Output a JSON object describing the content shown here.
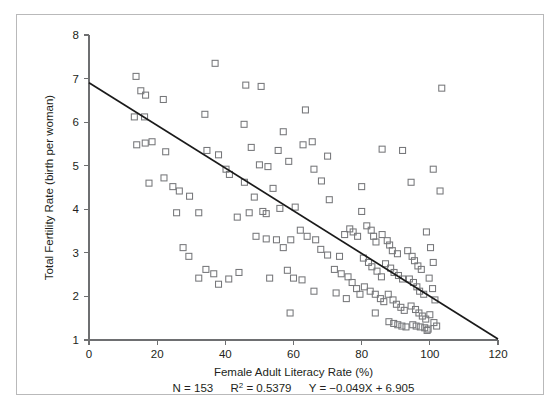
{
  "figure": {
    "background_color": "#ffffff",
    "border_color": "#b9b9ba",
    "marker_color": "#76777a",
    "line_color": "#1a1a1a",
    "axis_color": "#6e6f71"
  },
  "chart_data": {
    "type": "scatter",
    "title": "",
    "xlabel": "Female Adult Literacy Rate (%)",
    "ylabel": "Total Fertility Rate (birth per woman)",
    "xlim": [
      0,
      120
    ],
    "ylim": [
      1,
      8
    ],
    "xticks": [
      0,
      20,
      40,
      60,
      80,
      100,
      120
    ],
    "yticks": [
      1,
      2,
      3,
      4,
      5,
      6,
      7,
      8
    ],
    "xtick_labels": [
      "0",
      "20",
      "40",
      "60",
      "80",
      "100",
      "120"
    ],
    "ytick_labels": [
      "1",
      "2",
      "3",
      "4",
      "5",
      "6",
      "7",
      "8"
    ],
    "grid": false,
    "legend": null,
    "marker_style": "open-square",
    "annotations": {
      "n_label": "N = 153",
      "r2_label_prefix": "R",
      "r2_label_sup": "2",
      "r2_label_value": " = 0.5379",
      "equation": "Y = −0.049X + 6.905",
      "stats_text": "N = 153    R2 = 0.5379    Y = −0.049X + 6.905"
    },
    "fit": {
      "type": "linear",
      "slope": -0.049,
      "intercept": 6.905,
      "r_squared": 0.5379,
      "n": 153,
      "x_start": 0,
      "y_start": 6.905,
      "x_end": 120,
      "y_end": 1.025
    },
    "points": [
      [
        13.8,
        7.05
      ],
      [
        15.2,
        6.72
      ],
      [
        16.6,
        6.62
      ],
      [
        13.3,
        6.12
      ],
      [
        16.3,
        6.12
      ],
      [
        21.8,
        6.52
      ],
      [
        14.0,
        5.48
      ],
      [
        16.5,
        5.52
      ],
      [
        18.5,
        5.55
      ],
      [
        22.5,
        5.32
      ],
      [
        17.6,
        4.6
      ],
      [
        22.0,
        4.72
      ],
      [
        24.6,
        4.52
      ],
      [
        26.5,
        4.42
      ],
      [
        29.5,
        4.3
      ],
      [
        25.7,
        3.92
      ],
      [
        32.2,
        3.92
      ],
      [
        27.6,
        3.12
      ],
      [
        29.3,
        2.92
      ],
      [
        32.2,
        2.42
      ],
      [
        37.0,
        7.35
      ],
      [
        34.0,
        6.18
      ],
      [
        34.6,
        5.35
      ],
      [
        38.0,
        5.25
      ],
      [
        40.2,
        4.92
      ],
      [
        41.2,
        4.8
      ],
      [
        41.0,
        2.4
      ],
      [
        34.3,
        2.62
      ],
      [
        36.6,
        2.52
      ],
      [
        38.0,
        2.28
      ],
      [
        46.0,
        6.85
      ],
      [
        50.5,
        6.82
      ],
      [
        45.5,
        5.95
      ],
      [
        47.6,
        5.42
      ],
      [
        50.0,
        5.02
      ],
      [
        45.6,
        4.62
      ],
      [
        48.5,
        4.28
      ],
      [
        51.0,
        3.95
      ],
      [
        47.0,
        3.92
      ],
      [
        52.0,
        3.9
      ],
      [
        52.5,
        4.98
      ],
      [
        55.5,
        5.35
      ],
      [
        57.0,
        5.78
      ],
      [
        58.6,
        5.1
      ],
      [
        54.0,
        4.48
      ],
      [
        56.0,
        4.02
      ],
      [
        52.0,
        3.32
      ],
      [
        55.0,
        3.3
      ],
      [
        57.0,
        3.12
      ],
      [
        59.2,
        3.3
      ],
      [
        60.5,
        4.05
      ],
      [
        62.0,
        3.52
      ],
      [
        58.2,
        2.6
      ],
      [
        60.0,
        2.42
      ],
      [
        62.5,
        2.38
      ],
      [
        59.0,
        1.62
      ],
      [
        65.5,
        5.55
      ],
      [
        66.0,
        4.92
      ],
      [
        68.2,
        4.65
      ],
      [
        70.5,
        4.22
      ],
      [
        64.0,
        3.38
      ],
      [
        66.5,
        3.3
      ],
      [
        68.0,
        3.08
      ],
      [
        70.0,
        2.95
      ],
      [
        72.0,
        2.62
      ],
      [
        73.5,
        2.92
      ],
      [
        75.0,
        3.42
      ],
      [
        76.5,
        3.55
      ],
      [
        77.5,
        3.48
      ],
      [
        78.8,
        3.38
      ],
      [
        74.0,
        2.52
      ],
      [
        76.0,
        2.45
      ],
      [
        77.2,
        2.32
      ],
      [
        78.5,
        2.18
      ],
      [
        79.5,
        2.05
      ],
      [
        80.0,
        3.95
      ],
      [
        81.5,
        3.62
      ],
      [
        82.8,
        3.52
      ],
      [
        83.5,
        3.38
      ],
      [
        84.2,
        3.25
      ],
      [
        80.5,
        2.88
      ],
      [
        82.0,
        2.78
      ],
      [
        83.0,
        2.68
      ],
      [
        84.5,
        2.58
      ],
      [
        85.8,
        2.45
      ],
      [
        80.8,
        2.22
      ],
      [
        82.5,
        2.12
      ],
      [
        84.0,
        2.05
      ],
      [
        85.5,
        1.95
      ],
      [
        86.5,
        1.88
      ],
      [
        86.0,
        3.42
      ],
      [
        87.5,
        3.28
      ],
      [
        88.2,
        3.18
      ],
      [
        89.0,
        3.05
      ],
      [
        90.5,
        2.98
      ],
      [
        87.0,
        2.75
      ],
      [
        88.5,
        2.65
      ],
      [
        89.5,
        2.55
      ],
      [
        90.8,
        2.48
      ],
      [
        92.0,
        2.4
      ],
      [
        87.8,
        2.05
      ],
      [
        89.2,
        1.92
      ],
      [
        90.2,
        1.82
      ],
      [
        91.5,
        1.75
      ],
      [
        92.5,
        1.68
      ],
      [
        88.0,
        1.42
      ],
      [
        89.4,
        1.38
      ],
      [
        90.6,
        1.35
      ],
      [
        91.8,
        1.32
      ],
      [
        93.0,
        1.3
      ],
      [
        93.5,
        3.05
      ],
      [
        94.8,
        2.92
      ],
      [
        95.5,
        2.82
      ],
      [
        96.5,
        2.7
      ],
      [
        97.5,
        2.62
      ],
      [
        94.0,
        2.4
      ],
      [
        95.2,
        2.32
      ],
      [
        96.2,
        2.22
      ],
      [
        97.0,
        2.12
      ],
      [
        98.2,
        2.05
      ],
      [
        94.5,
        1.78
      ],
      [
        95.8,
        1.7
      ],
      [
        96.8,
        1.62
      ],
      [
        97.8,
        1.55
      ],
      [
        98.8,
        1.48
      ],
      [
        95.0,
        1.35
      ],
      [
        96.0,
        1.32
      ],
      [
        97.2,
        1.3
      ],
      [
        98.5,
        1.28
      ],
      [
        99.5,
        1.25
      ],
      [
        99.0,
        3.48
      ],
      [
        100.2,
        3.12
      ],
      [
        101.0,
        2.78
      ],
      [
        99.8,
        2.42
      ],
      [
        100.8,
        2.18
      ],
      [
        101.5,
        1.92
      ],
      [
        100.0,
        1.58
      ],
      [
        101.2,
        1.4
      ],
      [
        102.0,
        1.32
      ],
      [
        99.2,
        1.22
      ],
      [
        103.5,
        6.78
      ],
      [
        101.0,
        4.92
      ],
      [
        103.0,
        4.42
      ],
      [
        92.0,
        5.35
      ],
      [
        94.5,
        4.62
      ],
      [
        86.0,
        5.38
      ],
      [
        80.0,
        4.52
      ],
      [
        70.0,
        5.22
      ],
      [
        63.5,
        6.28
      ],
      [
        62.8,
        5.48
      ],
      [
        49.0,
        3.38
      ],
      [
        43.5,
        3.82
      ],
      [
        44.0,
        2.55
      ],
      [
        53.0,
        2.42
      ],
      [
        66.0,
        2.12
      ],
      [
        72.5,
        2.08
      ],
      [
        75.5,
        1.95
      ],
      [
        84.0,
        1.62
      ]
    ]
  }
}
